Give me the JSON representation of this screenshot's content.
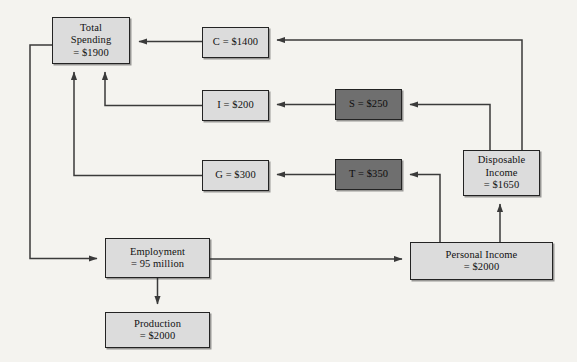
{
  "diagram": {
    "background_color": "#f4f3ef",
    "line_color": "#3a3a3a",
    "box_fill_light": "#dcdcdc",
    "box_fill_dark": "#6f6f6f",
    "box_border_color": "#232323",
    "nodes": [
      {
        "id": "total-spending",
        "label": "Total Spending = $1900",
        "line1": "Total",
        "line2": "Spending",
        "line3": "= $1900",
        "style": "light",
        "x": 52,
        "y": 17,
        "w": 78,
        "h": 47
      },
      {
        "id": "consumption",
        "label": "C = $1400",
        "line1": "C = $1400",
        "style": "light",
        "x": 202,
        "y": 27,
        "w": 67,
        "h": 31
      },
      {
        "id": "investment",
        "label": "I = $200",
        "line1": "I = $200",
        "style": "light",
        "x": 202,
        "y": 90,
        "w": 67,
        "h": 31
      },
      {
        "id": "government",
        "label": "G = $300",
        "line1": "G = $300",
        "style": "light",
        "x": 202,
        "y": 160,
        "w": 67,
        "h": 31
      },
      {
        "id": "saving",
        "label": "S = $250",
        "line1": "S = $250",
        "style": "dark",
        "x": 335,
        "y": 89,
        "w": 67,
        "h": 31
      },
      {
        "id": "taxes",
        "label": "T = $350",
        "line1": "T = $350",
        "style": "dark",
        "x": 335,
        "y": 159,
        "w": 67,
        "h": 31
      },
      {
        "id": "disposable-income",
        "label": "Disposable Income = $1650",
        "line1": "Disposable",
        "line2": "Income",
        "line3": "= $1650",
        "style": "light",
        "x": 463,
        "y": 150,
        "w": 77,
        "h": 46
      },
      {
        "id": "personal-income",
        "label": "Personal Income = $2000",
        "line1": "Personal Income",
        "line2": "= $2000",
        "style": "light",
        "x": 410,
        "y": 242,
        "w": 143,
        "h": 38
      },
      {
        "id": "employment",
        "label": "Employment = 95 million",
        "line1": "Employment",
        "line2": "= 95 million",
        "style": "light",
        "x": 105,
        "y": 238,
        "w": 105,
        "h": 40
      },
      {
        "id": "production",
        "label": "Production = $2000",
        "line1": "Production",
        "line2": "= $2000",
        "style": "light",
        "x": 105,
        "y": 312,
        "w": 105,
        "h": 36
      }
    ],
    "edges": [
      {
        "id": "consumption-to-total-spending",
        "from": "consumption",
        "to": "total-spending"
      },
      {
        "id": "investment-to-total-spending",
        "from": "investment",
        "to": "total-spending"
      },
      {
        "id": "government-to-total-spending",
        "from": "government",
        "to": "total-spending"
      },
      {
        "id": "saving-to-investment",
        "from": "saving",
        "to": "investment"
      },
      {
        "id": "taxes-to-government",
        "from": "taxes",
        "to": "government"
      },
      {
        "id": "disposable-income-to-consumption",
        "from": "disposable-income",
        "to": "consumption"
      },
      {
        "id": "disposable-income-to-saving",
        "from": "disposable-income",
        "to": "saving"
      },
      {
        "id": "personal-income-to-disposable-income",
        "from": "personal-income",
        "to": "disposable-income"
      },
      {
        "id": "personal-income-to-taxes",
        "from": "personal-income",
        "to": "taxes"
      },
      {
        "id": "total-spending-to-employment",
        "from": "total-spending",
        "to": "employment"
      },
      {
        "id": "employment-to-personal-income",
        "from": "employment",
        "to": "personal-income"
      },
      {
        "id": "employment-to-production",
        "from": "employment",
        "to": "production"
      }
    ]
  }
}
